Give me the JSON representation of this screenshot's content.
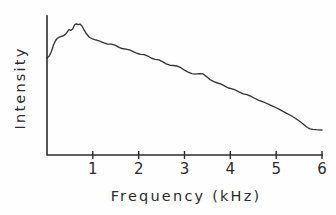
{
  "chart_data": {
    "type": "line",
    "title": "",
    "xlabel": "Frequency (kHz)",
    "ylabel": "Intensity",
    "xlim": [
      0,
      6
    ],
    "ylim": [
      0,
      1
    ],
    "grid": false,
    "legend": null,
    "x_tick_labels": [
      "1",
      "2",
      "3",
      "4",
      "5",
      "6"
    ],
    "x_tick_values": [
      1,
      2,
      3,
      4,
      5,
      6
    ],
    "y_tick_labels": [],
    "y_tick_values": [],
    "series": [
      {
        "name": "spectrum",
        "color": "#333333",
        "x": [
          0.0,
          0.05,
          0.1,
          0.14,
          0.18,
          0.22,
          0.26,
          0.3,
          0.34,
          0.38,
          0.43,
          0.48,
          0.52,
          0.56,
          0.6,
          0.64,
          0.68,
          0.72,
          0.76,
          0.8,
          0.86,
          0.92,
          0.98,
          1.04,
          1.1,
          1.16,
          1.24,
          1.32,
          1.4,
          1.48,
          1.56,
          1.64,
          1.72,
          1.8,
          1.88,
          1.96,
          2.04,
          2.12,
          2.2,
          2.28,
          2.36,
          2.44,
          2.52,
          2.6,
          2.68,
          2.76,
          2.84,
          2.92,
          3.0,
          3.08,
          3.16,
          3.24,
          3.32,
          3.4,
          3.48,
          3.56,
          3.64,
          3.72,
          3.8,
          3.88,
          3.96,
          4.04,
          4.12,
          4.2,
          4.28,
          4.36,
          4.44,
          4.52,
          4.6,
          4.68,
          4.76,
          4.84,
          4.92,
          5.0,
          5.08,
          5.16,
          5.24,
          5.32,
          5.4,
          5.48,
          5.56,
          5.62,
          5.68,
          5.74,
          5.8,
          5.88,
          6.0
        ],
        "y": [
          0.698,
          0.712,
          0.748,
          0.79,
          0.82,
          0.838,
          0.846,
          0.852,
          0.856,
          0.862,
          0.88,
          0.902,
          0.896,
          0.906,
          0.936,
          0.944,
          0.938,
          0.942,
          0.93,
          0.906,
          0.872,
          0.848,
          0.838,
          0.83,
          0.824,
          0.818,
          0.806,
          0.798,
          0.798,
          0.79,
          0.776,
          0.766,
          0.762,
          0.756,
          0.744,
          0.732,
          0.724,
          0.722,
          0.712,
          0.696,
          0.688,
          0.684,
          0.672,
          0.656,
          0.646,
          0.644,
          0.64,
          0.628,
          0.61,
          0.596,
          0.586,
          0.582,
          0.586,
          0.584,
          0.564,
          0.542,
          0.528,
          0.518,
          0.51,
          0.496,
          0.482,
          0.476,
          0.466,
          0.452,
          0.44,
          0.434,
          0.424,
          0.41,
          0.396,
          0.386,
          0.376,
          0.364,
          0.352,
          0.34,
          0.326,
          0.312,
          0.298,
          0.284,
          0.268,
          0.25,
          0.23,
          0.214,
          0.198,
          0.188,
          0.184,
          0.182,
          0.18
        ]
      }
    ]
  },
  "axes": {
    "x_title": "Frequency (kHz)",
    "y_title": "Intensity"
  }
}
